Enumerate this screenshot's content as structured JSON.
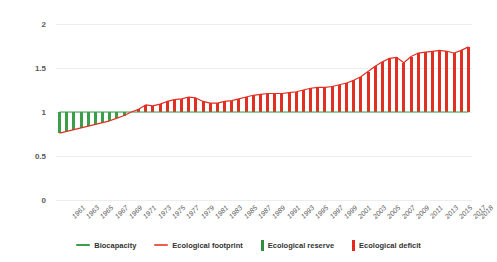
{
  "chart_data": {
    "type": "bar",
    "title": "",
    "subtitle": "",
    "xlabel": "",
    "ylabel": "",
    "ylim": [
      0,
      2
    ],
    "yticks": [
      "0",
      "0.5",
      "1",
      "1.5",
      "2"
    ],
    "ytick_values": [
      0,
      0.5,
      1,
      1.5,
      2
    ],
    "grid": true,
    "legend_position": "bottom",
    "x": [
      1961,
      1962,
      1963,
      1964,
      1965,
      1966,
      1967,
      1968,
      1969,
      1970,
      1971,
      1972,
      1973,
      1974,
      1975,
      1976,
      1977,
      1978,
      1979,
      1980,
      1981,
      1982,
      1983,
      1984,
      1985,
      1986,
      1987,
      1988,
      1989,
      1990,
      1991,
      1992,
      1993,
      1994,
      1995,
      1996,
      1997,
      1998,
      1999,
      2000,
      2001,
      2002,
      2003,
      2004,
      2005,
      2006,
      2007,
      2008,
      2009,
      2010,
      2011,
      2012,
      2013,
      2014,
      2015,
      2016,
      2017,
      2018
    ],
    "xtick_labels": [
      "1961",
      "1963",
      "1965",
      "1967",
      "1969",
      "1971",
      "1973",
      "1975",
      "1977",
      "1979",
      "1981",
      "1983",
      "1985",
      "1987",
      "1989",
      "1991",
      "1993",
      "1995",
      "1997",
      "1999",
      "2001",
      "2003",
      "2005",
      "2007",
      "2009",
      "2011",
      "2013",
      "2015",
      "2017",
      "2018"
    ],
    "series": [
      {
        "name": "Biocapacity",
        "color": "#3a9e4a",
        "kind": "line",
        "values": [
          1,
          1,
          1,
          1,
          1,
          1,
          1,
          1,
          1,
          1,
          1,
          1,
          1,
          1,
          1,
          1,
          1,
          1,
          1,
          1,
          1,
          1,
          1,
          1,
          1,
          1,
          1,
          1,
          1,
          1,
          1,
          1,
          1,
          1,
          1,
          1,
          1,
          1,
          1,
          1,
          1,
          1,
          1,
          1,
          1,
          1,
          1,
          1,
          1,
          1,
          1,
          1,
          1,
          1,
          1,
          1,
          1,
          1
        ]
      },
      {
        "name": "Ecological footprint",
        "color": "#e03024",
        "kind": "line",
        "values": [
          0.76,
          0.78,
          0.8,
          0.82,
          0.84,
          0.86,
          0.88,
          0.9,
          0.93,
          0.96,
          1.0,
          1.03,
          1.08,
          1.07,
          1.09,
          1.12,
          1.14,
          1.15,
          1.17,
          1.16,
          1.12,
          1.1,
          1.1,
          1.12,
          1.13,
          1.15,
          1.17,
          1.19,
          1.2,
          1.21,
          1.21,
          1.21,
          1.22,
          1.23,
          1.25,
          1.27,
          1.28,
          1.28,
          1.29,
          1.31,
          1.33,
          1.36,
          1.4,
          1.46,
          1.52,
          1.57,
          1.61,
          1.62,
          1.56,
          1.63,
          1.67,
          1.68,
          1.69,
          1.7,
          1.69,
          1.67,
          1.7,
          1.74
        ]
      }
    ],
    "bars": [
      {
        "name": "Ecological reserve",
        "color": "#3a9e4a",
        "description": "green bar where biocapacity exceeds footprint (1961-1970)"
      },
      {
        "name": "Ecological deficit",
        "color": "#e03024",
        "description": "red bar where footprint exceeds biocapacity (1971-2018)"
      }
    ]
  },
  "legend": {
    "items": [
      {
        "label": "Biocapacity",
        "color": "#3a9e4a",
        "marker": "line"
      },
      {
        "label": "Ecological footprint",
        "color": "#e8604c",
        "marker": "line"
      },
      {
        "label": "Ecological reserve",
        "color": "#2f8f3f",
        "marker": "bar"
      },
      {
        "label": "Ecological deficit",
        "color": "#e8271b",
        "marker": "bar"
      }
    ]
  },
  "axis": {
    "y_ticks": [
      "2",
      "1.5",
      "1",
      "0.5",
      "0"
    ]
  }
}
